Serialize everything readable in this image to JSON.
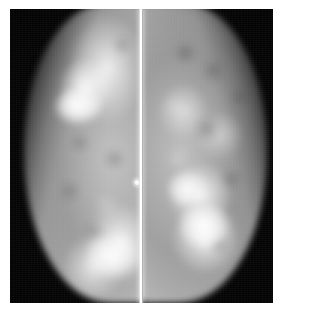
{
  "figure": {
    "kind": "medical-image",
    "modality": "mammogram",
    "caption": "",
    "background_color": "#ffffff",
    "plate_color": "#050505",
    "highlight_color": "#ffffff",
    "midtone_color": "#b4b4b4",
    "frame": {
      "left": 10,
      "top": 9,
      "width": 263,
      "height": 294
    }
  },
  "panels": [
    {
      "id": "panel-left",
      "label": "left-view",
      "tissue_side": "right",
      "silhouette": "convex border sweeping from upper right down to the lower left",
      "findings": [
        {
          "name": "upper-dense-mass",
          "position": "upper left of parenchyma",
          "brightness": "very bright"
        },
        {
          "name": "lower-dense-region",
          "position": "lower centre near divider",
          "brightness": "very bright"
        }
      ]
    },
    {
      "id": "panel-right",
      "label": "right-view",
      "tissue_side": "left",
      "silhouette": "mirrored convex border sweeping from upper left down to the lower right",
      "findings": [
        {
          "name": "mid-nodule",
          "position": "mid lower-left of parenchyma",
          "brightness": "bright"
        },
        {
          "name": "lower-nodule",
          "position": "lower-left of parenchyma",
          "brightness": "very bright"
        }
      ]
    }
  ],
  "divider": {
    "name": "view-separator",
    "color": "#ffffff",
    "x": 139,
    "width": 4
  },
  "marker": {
    "name": "skin-marker",
    "color": "#ffffff",
    "x": 136,
    "y": 181
  }
}
